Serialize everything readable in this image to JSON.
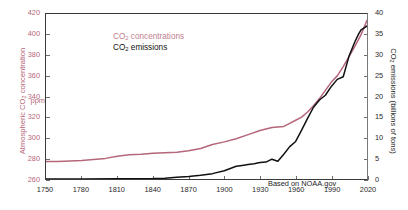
{
  "chart_data": {
    "type": "line",
    "title": "",
    "subtitle": "",
    "xlabel": "",
    "ylabel": "Atmospheric CO2 concentration",
    "ylabel_secondary": "CO2 emissions (billions of tons)",
    "ylabel_left_parts": {
      "prefix": "Atmospheric CO",
      "sub": "2",
      "suffix": " concentration"
    },
    "ylabel_right_parts": {
      "prefix": "CO",
      "sub": "2",
      "suffix": " emissions (billions of tons)"
    },
    "unit_note": "ppm",
    "grid": false,
    "legend_position": "top-left",
    "annotation": "Based on NOAA.gov",
    "xlim": [
      1750,
      2020
    ],
    "xticks": [
      "1750",
      "1780",
      "1810",
      "1840",
      "1870",
      "1900",
      "1930",
      "1960",
      "1990",
      "2020"
    ],
    "xtick_values": [
      1750,
      1780,
      1810,
      1840,
      1870,
      1900,
      1930,
      1960,
      1990,
      2020
    ],
    "ylim_left": [
      260,
      420
    ],
    "yticks_left": [
      "260",
      "280",
      "300",
      "320",
      "340",
      "360",
      "380",
      "400",
      "420"
    ],
    "ytick_values_left": [
      260,
      280,
      300,
      320,
      340,
      360,
      380,
      400,
      420
    ],
    "ylim_right": [
      0,
      40
    ],
    "yticks_right": [
      "0",
      "5",
      "10",
      "15",
      "20",
      "25",
      "30",
      "35",
      "40"
    ],
    "ytick_values_right": [
      0,
      5,
      10,
      15,
      20,
      25,
      30,
      35,
      40
    ],
    "colors": {
      "concentration": "#b5667a",
      "emissions": "#111111",
      "axis": "#3a3a3a",
      "tick": "#6d6d6d",
      "background": "#ffffff"
    },
    "series": [
      {
        "name": "CO2 concentrations",
        "legend_parts": {
          "prefix": "CO",
          "sub": "2",
          "suffix": " concentrations"
        },
        "axis": "left",
        "color": "#b5667a",
        "unit": "ppm",
        "x": [
          1750,
          1760,
          1770,
          1780,
          1790,
          1800,
          1810,
          1820,
          1830,
          1840,
          1850,
          1860,
          1870,
          1880,
          1890,
          1900,
          1910,
          1920,
          1930,
          1940,
          1950,
          1955,
          1960,
          1965,
          1970,
          1975,
          1980,
          1985,
          1990,
          1995,
          2000,
          2005,
          2010,
          2015,
          2020
        ],
        "values": [
          277,
          277,
          277.5,
          278,
          279,
          280,
          282,
          283.5,
          284,
          285,
          285.5,
          286,
          287.5,
          289.5,
          293.5,
          296,
          299,
          303,
          307,
          310,
          311,
          314,
          317,
          320,
          325,
          331,
          338,
          346,
          354,
          360,
          369,
          379,
          389,
          400,
          414
        ]
      },
      {
        "name": "CO2 emissions",
        "legend_parts": {
          "prefix": "CO",
          "sub": "2",
          "suffix": " emissions"
        },
        "axis": "right",
        "color": "#111111",
        "unit": "billions of tons",
        "x": [
          1750,
          1780,
          1810,
          1840,
          1850,
          1860,
          1870,
          1880,
          1890,
          1900,
          1910,
          1915,
          1920,
          1925,
          1930,
          1935,
          1940,
          1945,
          1950,
          1955,
          1960,
          1965,
          1970,
          1975,
          1980,
          1985,
          1990,
          1995,
          2000,
          2005,
          2010,
          2013,
          2015,
          2018,
          2020
        ],
        "values": [
          0,
          0.01,
          0.03,
          0.1,
          0.2,
          0.4,
          0.6,
          0.9,
          1.3,
          2.0,
          3.1,
          3.3,
          3.5,
          3.7,
          4.0,
          4.1,
          4.8,
          4.3,
          6.0,
          7.6,
          9.4,
          11.5,
          14.9,
          17.0,
          19.5,
          20.0,
          22.7,
          23.7,
          25.2,
          29.6,
          33.2,
          35.5,
          35.8,
          36.9,
          37.1
        ]
      }
    ]
  }
}
